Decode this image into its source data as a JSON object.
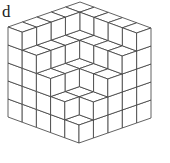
{
  "figure": {
    "label": "d",
    "grid_size": 5,
    "stroke_color": "#3a3a3a",
    "face_color": "#ffffff",
    "heights": [
      [
        5,
        5,
        5,
        5,
        5
      ],
      [
        5,
        4,
        4,
        4,
        4
      ],
      [
        5,
        4,
        3,
        3,
        3
      ],
      [
        5,
        4,
        3,
        2,
        2
      ],
      [
        5,
        4,
        3,
        2,
        1
      ]
    ]
  }
}
